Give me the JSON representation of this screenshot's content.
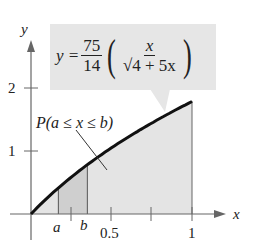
{
  "chart_data": {
    "type": "area",
    "title": "",
    "function": "y = 75/14 * (x / sqrt(4 + 5x))",
    "equation_label": {
      "lhs": "y =",
      "coef_num": "75",
      "coef_den": "14",
      "inner_num": "x",
      "inner_den": "√4 + 5x"
    },
    "region_label": "P(a ≤ x ≤ b)",
    "xlabel": "x",
    "ylabel": "y",
    "xlim": [
      0,
      1
    ],
    "ylim": [
      0,
      2
    ],
    "x_ticks": [
      0.25,
      0.5,
      0.75,
      1
    ],
    "x_tick_labels": [
      "0.5",
      "1"
    ],
    "y_ticks": [
      1,
      2
    ],
    "y_tick_labels": [
      "1",
      "2"
    ],
    "shaded_interval": {
      "a": 0.17,
      "b": 0.35,
      "a_label": "a",
      "b_label": "b"
    },
    "x": [
      0,
      0.1,
      0.2,
      0.3,
      0.4,
      0.5,
      0.6,
      0.7,
      0.8,
      0.9,
      1.0
    ],
    "y": [
      0,
      0.25,
      0.46,
      0.65,
      0.82,
      0.99,
      1.14,
      1.29,
      1.44,
      1.57,
      1.79
    ]
  },
  "labels": {
    "y_axis": "y",
    "x_axis": "x",
    "tick_2": "2",
    "tick_1": "1",
    "tick_05": "0.5",
    "tick_x1": "1",
    "a": "a",
    "b": "b",
    "region": "P(a ≤ x ≤ b)"
  },
  "equation": {
    "lhs": "y =",
    "c_num": "75",
    "c_den": "14",
    "i_num": "x",
    "i_den": "√4 + 5x"
  }
}
